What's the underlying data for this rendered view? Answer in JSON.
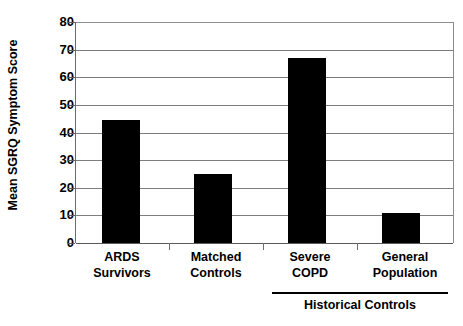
{
  "chart_data": {
    "type": "bar",
    "title": "",
    "subtitle": "",
    "xlabel": "",
    "ylabel": "Mean SGRQ Symptom Score",
    "categories": [
      "ARDS Survivors",
      "Matched Controls",
      "Severe COPD",
      "General Population"
    ],
    "category_lines": [
      [
        "ARDS",
        "Survivors"
      ],
      [
        "Matched",
        "Controls"
      ],
      [
        "Severe",
        "COPD"
      ],
      [
        "General",
        "Population"
      ]
    ],
    "values": [
      44.5,
      25,
      67,
      11
    ],
    "ylim": [
      0,
      80
    ],
    "ytick_step": 10,
    "ytick_labels": [
      "80",
      "70",
      "60",
      "50",
      "40",
      "30",
      "20",
      "10",
      "0"
    ],
    "grid": true,
    "legend": "none",
    "bar_color": "#000000",
    "grid_color": "#7d7d7d",
    "annotations": [
      {
        "name": "historical-controls-bracket",
        "label": "Historical Controls",
        "spans_categories": [
          "Severe COPD",
          "General Population"
        ]
      }
    ]
  },
  "axes": {
    "y_title": "Mean SGRQ Symptom Score"
  },
  "groups": {
    "historical_controls_label": "Historical Controls"
  }
}
